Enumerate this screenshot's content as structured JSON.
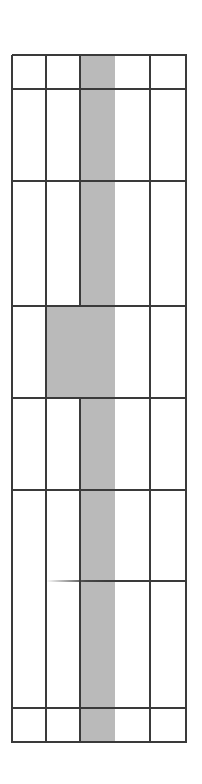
{
  "diagram": {
    "type": "grid",
    "colors": {
      "background": "#ffffff",
      "line": "#3a3a3a",
      "shade": "#bababa"
    },
    "columns_x": [
      12,
      46,
      80,
      115,
      150,
      186
    ],
    "rows_y": [
      55,
      89,
      181,
      306,
      398,
      490,
      581,
      708,
      742
    ],
    "shaded_regions": [
      {
        "x1": 80,
        "x2": 115,
        "y1": 55,
        "y2": 306
      },
      {
        "x1": 46,
        "x2": 115,
        "y1": 306,
        "y2": 398
      },
      {
        "x1": 80,
        "x2": 115,
        "y1": 398,
        "y2": 742
      }
    ],
    "vertical_lines": [
      {
        "x": 12,
        "y1": 55,
        "y2": 742
      },
      {
        "x": 46,
        "y1": 55,
        "y2": 742
      },
      {
        "x": 80,
        "y1": 55,
        "y2": 306
      },
      {
        "x": 80,
        "y1": 398,
        "y2": 742
      },
      {
        "x": 150,
        "y1": 55,
        "y2": 742
      },
      {
        "x": 186,
        "y1": 55,
        "y2": 742
      }
    ],
    "horizontal_lines": [
      {
        "y": 55,
        "x1": 12,
        "x2": 186
      },
      {
        "y": 89,
        "x1": 12,
        "x2": 186
      },
      {
        "y": 181,
        "x1": 12,
        "x2": 186
      },
      {
        "y": 306,
        "x1": 12,
        "x2": 186
      },
      {
        "y": 398,
        "x1": 12,
        "x2": 186
      },
      {
        "y": 490,
        "x1": 12,
        "x2": 186
      },
      {
        "y": 581,
        "x1": 46,
        "x2": 186,
        "faded_start": true
      },
      {
        "y": 708,
        "x1": 12,
        "x2": 186
      },
      {
        "y": 742,
        "x1": 12,
        "x2": 186
      }
    ]
  }
}
